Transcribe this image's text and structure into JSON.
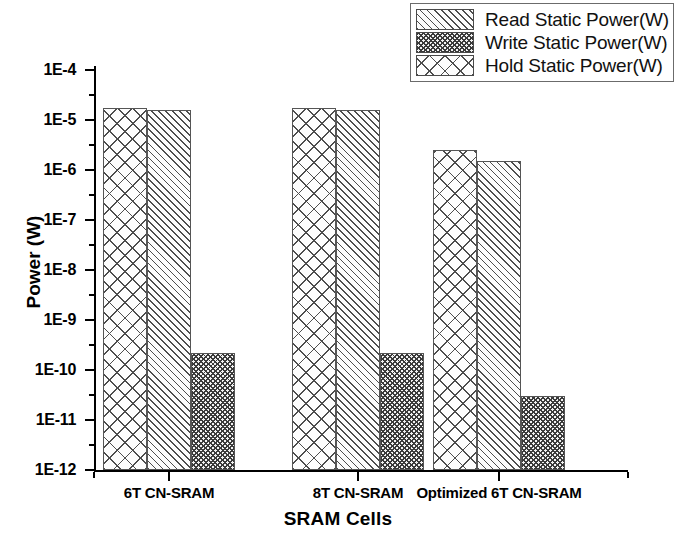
{
  "chart_data": {
    "type": "bar",
    "title": "",
    "xlabel": "SRAM Cells",
    "ylabel": "Power (W)",
    "yscale": "log",
    "ylim": [
      1e-12,
      0.0001
    ],
    "ytick_labels": [
      "1E-4",
      "1E-5",
      "1E-6",
      "1E-7",
      "1E-8",
      "1E-9",
      "1E-10",
      "1E-11",
      "1E-12"
    ],
    "categories": [
      "6T CN-SRAM",
      "8T CN-SRAM",
      "Optimized 6T CN-SRAM"
    ],
    "grid": false,
    "legend_position": "top-right",
    "series": [
      {
        "name": "Read Static Power(W)",
        "pattern": "diagonal-lines",
        "values": [
          1.6e-05,
          1.6e-05,
          1.5e-06
        ]
      },
      {
        "name": "Write Static Power(W)",
        "pattern": "dense-dots",
        "values": [
          2.2e-10,
          2.2e-10,
          3e-11
        ]
      },
      {
        "name": "Hold Static Power(W)",
        "pattern": "cross-hatch",
        "values": [
          1.7e-05,
          1.7e-05,
          2.5e-06
        ]
      }
    ],
    "draw_order": [
      "Hold Static Power(W)",
      "Read Static Power(W)",
      "Write Static Power(W)"
    ]
  },
  "legend": {
    "items": [
      {
        "label": "Read Static Power(W)",
        "pattern": "hatch-diag"
      },
      {
        "label": "Write Static Power(W)",
        "pattern": "hatch-dots"
      },
      {
        "label": "Hold Static Power(W)",
        "pattern": "hatch-cross"
      }
    ]
  },
  "axes": {
    "y_title": "Power (W)",
    "x_title": "SRAM Cells",
    "y_ticks": [
      "1E-4",
      "1E-5",
      "1E-6",
      "1E-7",
      "1E-8",
      "1E-9",
      "1E-10",
      "1E-11",
      "1E-12"
    ],
    "x_ticks": [
      "6T CN-SRAM",
      "8T CN-SRAM",
      "Optimized 6T CN-SRAM"
    ]
  }
}
